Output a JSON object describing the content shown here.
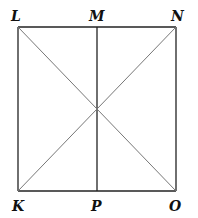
{
  "diagram": {
    "type": "geometry",
    "points": {
      "L": {
        "label": "L",
        "x": 18,
        "y": 27
      },
      "M": {
        "label": "M",
        "x": 97,
        "y": 27
      },
      "N": {
        "label": "N",
        "x": 176,
        "y": 27
      },
      "K": {
        "label": "K",
        "x": 18,
        "y": 191
      },
      "P": {
        "label": "P",
        "x": 97,
        "y": 191
      },
      "O": {
        "label": "O",
        "x": 176,
        "y": 191
      }
    },
    "segments": [
      {
        "from": "L",
        "to": "N",
        "style": "side"
      },
      {
        "from": "N",
        "to": "O",
        "style": "side"
      },
      {
        "from": "O",
        "to": "K",
        "style": "side"
      },
      {
        "from": "K",
        "to": "L",
        "style": "side"
      },
      {
        "from": "M",
        "to": "P",
        "style": "side"
      },
      {
        "from": "L",
        "to": "O",
        "style": "diagonal"
      },
      {
        "from": "K",
        "to": "N",
        "style": "diagonal"
      }
    ],
    "colors": {
      "side": "#222222",
      "diagonal": "#777777",
      "label": "#111111"
    }
  }
}
